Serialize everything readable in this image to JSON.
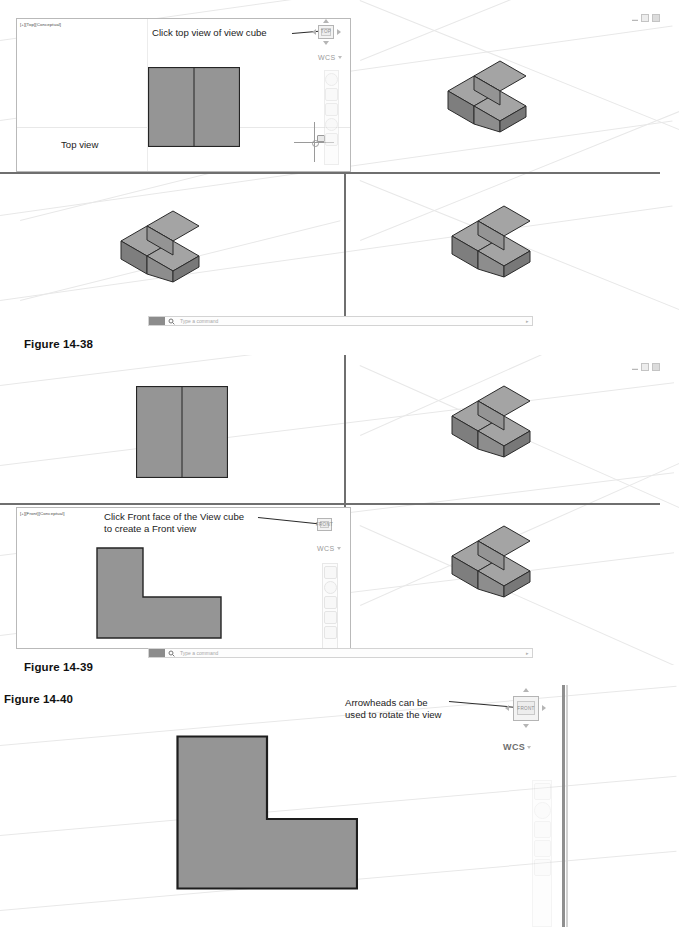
{
  "page": {
    "width": 679,
    "height": 927,
    "background": "#ffffff"
  },
  "colors": {
    "face_top": "#9b9b9b",
    "face_front": "#8a8a8a",
    "face_side": "#6f6f6f",
    "face_flat": "#939393",
    "outline": "#2b2b2b",
    "grid": "#e8e8e8",
    "separator": "#6f6f6f",
    "text": "#1b1b1b",
    "ui_gray": "#b4b4b4"
  },
  "figures": [
    {
      "id": "figure-14-38",
      "caption": "Figure 14-38",
      "viewport_label": "[+][Top][Conceptual]",
      "callout": "Click top view of view cube",
      "cad_text": "Top view",
      "viewcube_label": "TOP",
      "wcs_label": "WCS",
      "command_placeholder": "Type a command",
      "viewports": [
        {
          "name": "top-left",
          "content": "top-view-rectangle"
        },
        {
          "name": "top-right",
          "content": "isometric-L-block"
        },
        {
          "name": "bottom-left",
          "content": "isometric-L-block"
        },
        {
          "name": "bottom-right",
          "content": "isometric-L-block"
        }
      ]
    },
    {
      "id": "figure-14-39",
      "caption": "Figure 14-39",
      "viewport_label": "[+][Front][Conceptual]",
      "callout": "Click Front face of the View cube\nto create a Front view",
      "viewcube_label": "FRONT",
      "wcs_label": "WCS",
      "command_placeholder": "Type a command",
      "viewports": [
        {
          "name": "top-left",
          "content": "top-view-rectangle"
        },
        {
          "name": "top-right",
          "content": "isometric-L-block"
        },
        {
          "name": "bottom-left",
          "content": "front-view-L-shape"
        },
        {
          "name": "bottom-right",
          "content": "isometric-L-block"
        }
      ]
    },
    {
      "id": "figure-14-40",
      "caption": "Figure 14-40",
      "callout": "Arrowheads can be\nused to rotate the view",
      "viewcube_label": "FRONT",
      "wcs_label": "WCS",
      "viewports": [
        {
          "name": "main",
          "content": "front-view-L-shape-large"
        }
      ]
    }
  ],
  "window_controls": {
    "minimize": "minimize",
    "restore": "restore",
    "close": "close"
  },
  "icons": {
    "viewcube": "view-cube-icon",
    "arrow_left": "arrow-left-icon",
    "arrow_right": "arrow-right-icon",
    "arrow_up": "arrow-up-icon",
    "arrow_down": "arrow-down-icon",
    "magnifier": "magnifier-icon",
    "steering_wheel": "steering-wheel-icon",
    "pan": "pan-icon",
    "zoom": "zoom-icon",
    "orbit": "orbit-icon",
    "showmotion": "showmotion-icon"
  }
}
